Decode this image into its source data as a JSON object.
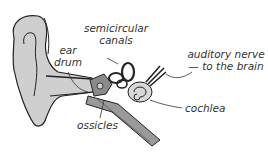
{
  "diagram": {
    "labels": {
      "semicircular_line1": "semicircular",
      "semicircular_line2": "canals",
      "ear_line1": "ear",
      "ear_line2": "drum",
      "auditory_line1": "auditory nerve",
      "auditory_line2": "— to the brain",
      "cochlea": "cochlea",
      "ossicles": "ossicles"
    },
    "colors": {
      "fill": "#cfcfcf",
      "dark_fill": "#8a8a8a",
      "stroke": "#222222",
      "text": "#333333"
    }
  }
}
